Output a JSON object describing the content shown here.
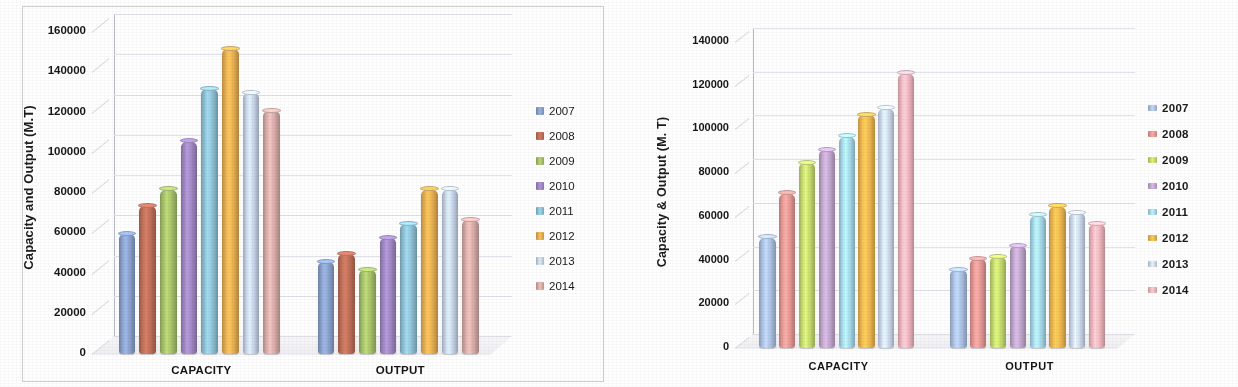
{
  "chart_data": [
    {
      "type": "bar",
      "title": "",
      "position": "left",
      "xlabel": "",
      "ylabel": "Capacity and Output (M.T)",
      "categories": [
        "CAPACITY",
        "OUTPUT"
      ],
      "ylim": [
        0,
        160000
      ],
      "yticks": [
        0,
        20000,
        40000,
        60000,
        80000,
        100000,
        120000,
        140000,
        160000
      ],
      "ytick_labels": [
        "0",
        "20000",
        "40000",
        "60000",
        "80000",
        "100000",
        "120000",
        "140000",
        "160000"
      ],
      "grid": true,
      "legend_position": "right",
      "series": [
        {
          "name": "2007",
          "color": "#8ba3ce",
          "values": [
            60000,
            46000
          ]
        },
        {
          "name": "2008",
          "color": "#c0705a",
          "values": [
            74000,
            50000
          ]
        },
        {
          "name": "2009",
          "color": "#a8c36a",
          "values": [
            82000,
            42000
          ]
        },
        {
          "name": "2010",
          "color": "#a188c4",
          "values": [
            106000,
            58000
          ]
        },
        {
          "name": "2011",
          "color": "#8fc3d6",
          "values": [
            132000,
            65000
          ]
        },
        {
          "name": "2012",
          "color": "#e8b052",
          "values": [
            152000,
            82000
          ]
        },
        {
          "name": "2013",
          "color": "#c8d6ea",
          "values": [
            130000,
            82000
          ]
        },
        {
          "name": "2014",
          "color": "#d9aeaa",
          "values": [
            121000,
            67000
          ]
        }
      ]
    },
    {
      "type": "bar",
      "title": "",
      "position": "right",
      "xlabel": "",
      "ylabel": "Capacity & Output (M. T)",
      "categories": [
        "CAPACITY",
        "OUTPUT"
      ],
      "ylim": [
        0,
        140000
      ],
      "yticks": [
        0,
        20000,
        40000,
        60000,
        80000,
        100000,
        120000,
        140000
      ],
      "ytick_labels": [
        "0",
        "20000",
        "40000",
        "60000",
        "80000",
        "100000",
        "120000",
        "140000"
      ],
      "grid": true,
      "legend_position": "right",
      "series": [
        {
          "name": "2007",
          "color": "#aec3e6",
          "values": [
            51000,
            36000
          ]
        },
        {
          "name": "2008",
          "color": "#e89a96",
          "values": [
            71000,
            41000
          ]
        },
        {
          "name": "2009",
          "color": "#c8dd70",
          "values": [
            85000,
            42000
          ]
        },
        {
          "name": "2010",
          "color": "#c3a8cf",
          "values": [
            91000,
            47000
          ]
        },
        {
          "name": "2011",
          "color": "#a8dced",
          "values": [
            97000,
            61000
          ]
        },
        {
          "name": "2012",
          "color": "#f0b950",
          "values": [
            107000,
            65000
          ]
        },
        {
          "name": "2013",
          "color": "#cfdcf0",
          "values": [
            110000,
            62000
          ]
        },
        {
          "name": "2014",
          "color": "#f3b8c0",
          "values": [
            126000,
            57000
          ]
        }
      ]
    }
  ]
}
